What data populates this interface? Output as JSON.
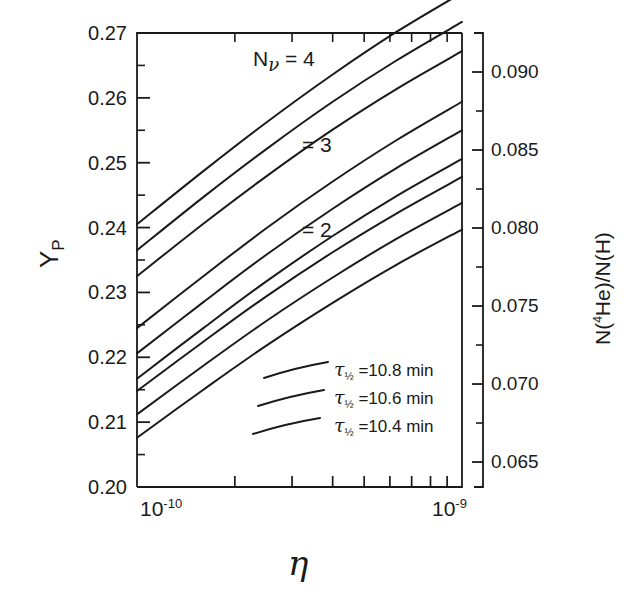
{
  "figure": {
    "name": "primordial-helium-abundance-vs-eta"
  },
  "chart_data": {
    "type": "line",
    "title": "",
    "xlabel": "η",
    "ylabel": "Y_P",
    "y2label": "N(4He)/N(H)",
    "xscale": "log",
    "xlim": [
      1e-10,
      1e-09
    ],
    "ylim": [
      0.2,
      0.27
    ],
    "y2lim": [
      0.0634,
      0.0925
    ],
    "grid": false,
    "legend_position": "inside-lower-center",
    "xticks": [
      {
        "value": 1e-10,
        "label": "10",
        "exponent": "-10"
      },
      {
        "value": 1e-09,
        "label": "10",
        "exponent": "-9"
      }
    ],
    "xminorticks": [
      2e-10,
      3e-10,
      4e-10,
      5e-10,
      6e-10,
      7e-10,
      8e-10,
      9e-10
    ],
    "yticks": [
      "0.20",
      "0.21",
      "0.22",
      "0.23",
      "0.24",
      "0.25",
      "0.26",
      "0.27"
    ],
    "yminorticks": [
      0.205,
      0.215,
      0.225,
      0.235,
      0.245,
      0.255,
      0.265
    ],
    "y2ticks": [
      "0.065",
      "0.070",
      "0.075",
      "0.080",
      "0.085",
      "0.090"
    ],
    "y2minorticks": [
      0.0675,
      0.0725,
      0.0775,
      0.0825,
      0.0875
    ],
    "annotations": [
      {
        "text": "N",
        "sub": "ν",
        "rest": " = 4",
        "x": 0.17,
        "y": 0.265
      },
      {
        "text": "",
        "sub": "",
        "rest": "= 3",
        "x": 0.3,
        "y": 0.2505
      },
      {
        "text": "",
        "sub": "",
        "rest": "= 2",
        "x": 0.3,
        "y": 0.2385
      }
    ],
    "legend": [
      {
        "label": "τ½ = 10.8 min",
        "tau_value": "10.8",
        "unit": "min"
      },
      {
        "label": "τ½ = 10.6 min",
        "tau_value": "10.6",
        "unit": "min"
      },
      {
        "label": "τ½ = 10.4 min",
        "tau_value": "10.4",
        "unit": "min"
      }
    ],
    "series": [
      {
        "name": "Nnu=4, tau=10.8 min",
        "n_nu": 4,
        "tau_half": 10.8,
        "x": [
          1e-10,
          1.6e-10,
          2.5e-10,
          4e-10,
          6.3e-10,
          1e-09
        ],
        "values": [
          0.2405,
          0.2487,
          0.2562,
          0.2636,
          0.2702,
          0.2762
        ]
      },
      {
        "name": "Nnu=4, tau=10.6 min",
        "n_nu": 4,
        "tau_half": 10.6,
        "x": [
          1e-10,
          1.6e-10,
          2.5e-10,
          4e-10,
          6.3e-10,
          1e-09
        ],
        "values": [
          0.2365,
          0.2447,
          0.2521,
          0.2594,
          0.2658,
          0.2717
        ]
      },
      {
        "name": "Nnu=4, tau=10.4 min",
        "n_nu": 4,
        "tau_half": 10.4,
        "x": [
          1e-10,
          1.6e-10,
          2.5e-10,
          4e-10,
          6.3e-10,
          1e-09
        ],
        "values": [
          0.2325,
          0.2406,
          0.2479,
          0.2551,
          0.2614,
          0.2672
        ]
      },
      {
        "name": "Nnu=3, tau=10.8 min",
        "n_nu": 3,
        "tau_half": 10.8,
        "x": [
          1e-10,
          1.6e-10,
          2.5e-10,
          4e-10,
          6.3e-10,
          1e-09
        ],
        "values": [
          0.2245,
          0.2325,
          0.2399,
          0.2471,
          0.2535,
          0.2594
        ]
      },
      {
        "name": "Nnu=3, tau=10.6 min",
        "n_nu": 3,
        "tau_half": 10.6,
        "x": [
          1e-10,
          1.6e-10,
          2.5e-10,
          4e-10,
          6.3e-10,
          1e-09
        ],
        "values": [
          0.2206,
          0.2285,
          0.2358,
          0.2429,
          0.2492,
          0.255
        ]
      },
      {
        "name": "Nnu=3, tau=10.4 min",
        "n_nu": 3,
        "tau_half": 10.4,
        "x": [
          1e-10,
          1.6e-10,
          2.5e-10,
          4e-10,
          6.3e-10,
          1e-09
        ],
        "values": [
          0.2167,
          0.2245,
          0.2317,
          0.2387,
          0.2449,
          0.2506
        ]
      },
      {
        "name": "Nnu=2, tau=10.8 min",
        "n_nu": 2,
        "tau_half": 10.8,
        "x": [
          1e-10,
          1.6e-10,
          2.5e-10,
          4e-10,
          6.3e-10,
          1e-09
        ],
        "values": [
          0.2148,
          0.2224,
          0.2294,
          0.2362,
          0.2422,
          0.2478
        ]
      },
      {
        "name": "Nnu=2, tau=10.6 min",
        "n_nu": 2,
        "tau_half": 10.6,
        "x": [
          1e-10,
          1.6e-10,
          2.5e-10,
          4e-10,
          6.3e-10,
          1e-09
        ],
        "values": [
          0.2112,
          0.2187,
          0.2256,
          0.2323,
          0.2383,
          0.2438
        ]
      },
      {
        "name": "Nnu=2, tau=10.4 min",
        "n_nu": 2,
        "tau_half": 10.4,
        "x": [
          1e-10,
          1.6e-10,
          2.5e-10,
          4e-10,
          6.3e-10,
          1e-09
        ],
        "values": [
          0.2076,
          0.215,
          0.2218,
          0.2284,
          0.2343,
          0.2397
        ]
      }
    ]
  },
  "labels": {
    "y_axis_main": "Y",
    "y_axis_main_sub": "P",
    "y_axis_right_pre": "N(",
    "y_axis_right_sup": "4",
    "y_axis_right_post": "He)/N(H)",
    "x_axis": "η",
    "x_tick_low_mantissa": "10",
    "x_tick_low_exp": "-10",
    "x_tick_high_mantissa": "10",
    "x_tick_high_exp": "-9",
    "nnu_symbol": "N",
    "nnu_sub": "ν",
    "nnu4": "= 4",
    "nnu3": "= 3",
    "nnu2": "= 2",
    "tau_symbol": "τ",
    "tau_sub": "½",
    "legend1": "=10.8 min",
    "legend2": "=10.6 min",
    "legend3": "=10.4 min"
  },
  "style": {
    "line_color": "#1a1a1a",
    "axis_color": "#1a1a1a",
    "background": "#ffffff"
  }
}
